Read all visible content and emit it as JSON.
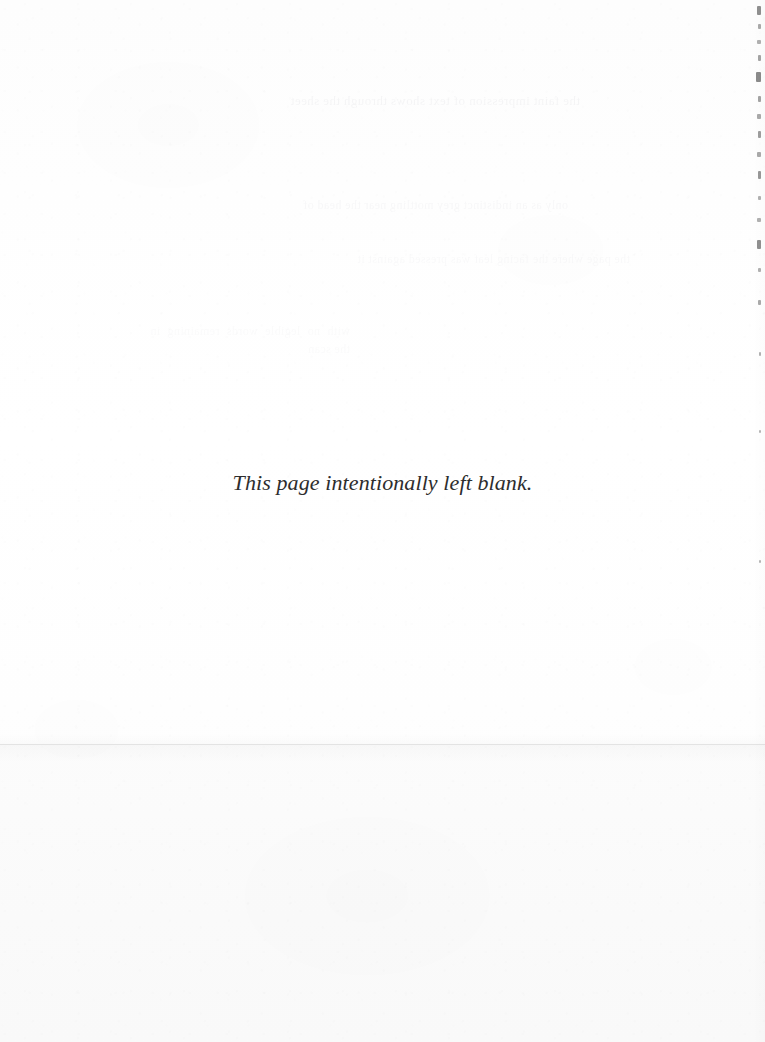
{
  "page": {
    "kind": "scanned-book-page",
    "width_px": 765,
    "height_px": 1042,
    "background_color": "#fefefe",
    "paper_tone": "#fdfdfd"
  },
  "content": {
    "blank_notice": "This page intentionally left blank."
  },
  "typography": {
    "notice_color": "#2b2b2b",
    "notice_style": "italic serif"
  },
  "artifacts": {
    "scan_seam": {
      "label": "horizontal scan seam line",
      "y_px": 744,
      "color": "#e3e3e3"
    },
    "bleed_through": {
      "label": "faint ghosted text from facing page",
      "color": "#5a5f69",
      "lines": [
        "the faint impression of text shows through the sheet",
        "only as an indistinct grey mottling near the head of",
        "the page where the facing leaf was pressed against it",
        "with no legible words remaining in the scan"
      ]
    },
    "edge_marks": {
      "label": "dark speckles along right page edge",
      "color": "#6b6b6b",
      "specks": [
        {
          "x": 757,
          "y": 6,
          "w": 4,
          "h": 9
        },
        {
          "x": 758,
          "y": 24,
          "w": 3,
          "h": 5
        },
        {
          "x": 757,
          "y": 40,
          "w": 4,
          "h": 4
        },
        {
          "x": 758,
          "y": 55,
          "w": 3,
          "h": 6
        },
        {
          "x": 756,
          "y": 72,
          "w": 5,
          "h": 10
        },
        {
          "x": 758,
          "y": 96,
          "w": 3,
          "h": 6
        },
        {
          "x": 757,
          "y": 114,
          "w": 4,
          "h": 5
        },
        {
          "x": 758,
          "y": 131,
          "w": 3,
          "h": 7
        },
        {
          "x": 757,
          "y": 152,
          "w": 4,
          "h": 5
        },
        {
          "x": 758,
          "y": 171,
          "w": 3,
          "h": 8
        },
        {
          "x": 758,
          "y": 196,
          "w": 3,
          "h": 4
        },
        {
          "x": 757,
          "y": 218,
          "w": 4,
          "h": 4
        },
        {
          "x": 757,
          "y": 240,
          "w": 4,
          "h": 9
        },
        {
          "x": 758,
          "y": 268,
          "w": 3,
          "h": 4
        },
        {
          "x": 758,
          "y": 300,
          "w": 3,
          "h": 5
        },
        {
          "x": 759,
          "y": 352,
          "w": 2,
          "h": 4
        },
        {
          "x": 759,
          "y": 430,
          "w": 2,
          "h": 3
        },
        {
          "x": 759,
          "y": 560,
          "w": 2,
          "h": 3
        }
      ]
    }
  }
}
